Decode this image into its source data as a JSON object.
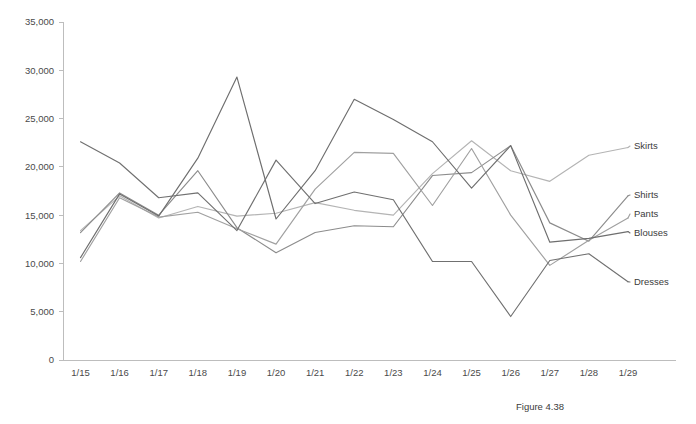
{
  "caption": "Figure 4.38",
  "chart_data": {
    "type": "line",
    "title": "",
    "xlabel": "",
    "ylabel": "",
    "ylim": [
      0,
      35000
    ],
    "ytick_interval": 5000,
    "grid": false,
    "legend_position": "right-inline-labels",
    "ytick_labels": [
      "35,000",
      "30,000",
      "25,000",
      "20,000",
      "15,000",
      "10,000",
      "5,000",
      "0"
    ],
    "ytick_values": [
      35000,
      30000,
      25000,
      20000,
      15000,
      10000,
      5000,
      0
    ],
    "categories": [
      "1/15",
      "1/16",
      "1/17",
      "1/18",
      "1/19",
      "1/20",
      "1/21",
      "1/22",
      "1/23",
      "1/24",
      "1/25",
      "1/26",
      "1/27",
      "1/28",
      "1/29"
    ],
    "series": [
      {
        "name": "Skirts",
        "color": "#b4b4b4",
        "values": [
          13400,
          17000,
          14700,
          15900,
          14900,
          15200,
          16300,
          15500,
          15000,
          19300,
          22700,
          19600,
          18500,
          21200,
          22000
        ]
      },
      {
        "name": "Shirts",
        "color": "#8c8c8c",
        "values": [
          13200,
          17300,
          15000,
          19600,
          13700,
          11100,
          13200,
          13900,
          13800,
          19100,
          19400,
          22200,
          14200,
          12300,
          17000
        ]
      },
      {
        "name": "Pants",
        "color": "#a0a0a0",
        "values": [
          10200,
          16800,
          14800,
          15300,
          13600,
          12000,
          17700,
          21500,
          21400,
          16000,
          21900,
          15000,
          9800,
          12400,
          14700
        ]
      },
      {
        "name": "Blouses",
        "color": "#6e6e6e",
        "values": [
          10600,
          17200,
          14900,
          20900,
          29300,
          14600,
          19600,
          27000,
          24900,
          22600,
          17800,
          22200,
          12200,
          12600,
          13300
        ]
      },
      {
        "name": "Dresses",
        "color": "#707070",
        "values": [
          22600,
          20400,
          16800,
          17300,
          13400,
          20700,
          16200,
          17400,
          16600,
          10200,
          10200,
          4500,
          10300,
          11000,
          8100
        ]
      }
    ]
  },
  "series_labels": [
    {
      "name": "Skirts"
    },
    {
      "name": "Shirts"
    },
    {
      "name": "Pants"
    },
    {
      "name": "Blouses"
    },
    {
      "name": "Dresses"
    }
  ]
}
